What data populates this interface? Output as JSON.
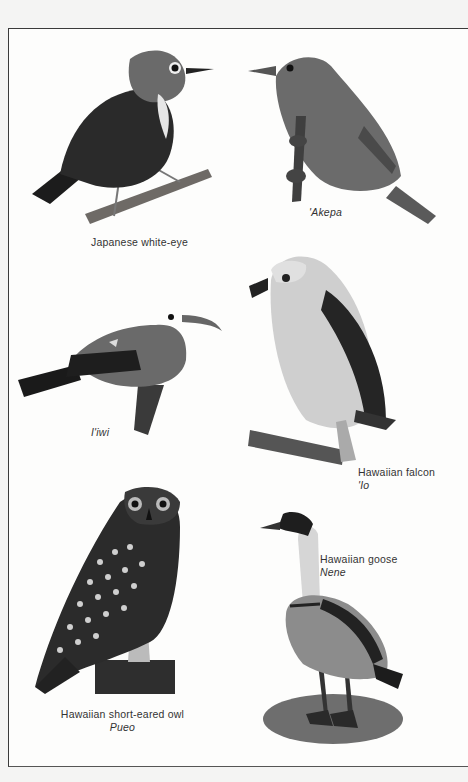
{
  "page": {
    "background": "#f4f4f3",
    "plate_background": "#fdfdfc",
    "border_color": "#3a3a3a"
  },
  "birds": [
    {
      "id": "japanese-white-eye",
      "common_name": "Japanese white-eye",
      "hawaiian_name": ""
    },
    {
      "id": "akepa",
      "common_name": "",
      "hawaiian_name": "'Akepa"
    },
    {
      "id": "iiwi",
      "common_name": "",
      "hawaiian_name": "I'iwi"
    },
    {
      "id": "hawaiian-falcon",
      "common_name": "Hawaiian falcon",
      "hawaiian_name": "'Io"
    },
    {
      "id": "hawaiian-short-eared-owl",
      "common_name": "Hawaiian short-eared owl",
      "hawaiian_name": "Pueo"
    },
    {
      "id": "hawaiian-goose",
      "common_name": "Hawaiian goose",
      "hawaiian_name": "Nene"
    }
  ]
}
